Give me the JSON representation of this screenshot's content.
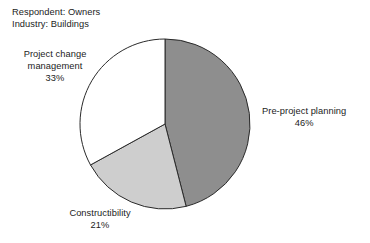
{
  "header": {
    "line1": "Respondent: Owners",
    "line2": "Industry: Buildings"
  },
  "chart_data": {
    "type": "pie",
    "title": "",
    "subtitle": "",
    "respondent": "Owners",
    "industry": "Buildings",
    "start_angle_deg": 0,
    "direction": "clockwise",
    "legend_position": "none",
    "labels_position": "outside",
    "categories": [
      "Pre-project planning",
      "Constructibility",
      "Project change management"
    ],
    "values": [
      46,
      21,
      33
    ],
    "unit": "%",
    "slices": [
      {
        "name": "Pre-project planning",
        "label_line1": "Pre-project planning",
        "label_line2": "46%",
        "value": 46,
        "color": "#8e8e8e",
        "start_deg": 0,
        "end_deg": 165.6
      },
      {
        "name": "Constructibility",
        "label_line1": "Constructibility",
        "label_line2": "21%",
        "value": 21,
        "color": "#cecece",
        "start_deg": 165.6,
        "end_deg": 241.2
      },
      {
        "name": "Project change management",
        "label_line1": "Project change",
        "label_line2": "management",
        "label_line3": "33%",
        "value": 33,
        "color": "#ffffff",
        "start_deg": 241.2,
        "end_deg": 360
      }
    ],
    "outline_color": "#2a2a2a",
    "background": "#ffffff",
    "geometry": {
      "center_x": 165,
      "center_y": 124,
      "radius": 85
    }
  }
}
